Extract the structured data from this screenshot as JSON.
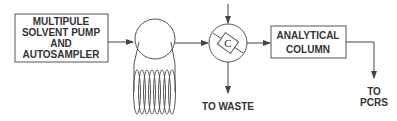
{
  "diagram": {
    "type": "flow-schematic",
    "nodes": {
      "pump": {
        "lines": [
          "MULTIPULE",
          "SOLVENT PUMP",
          "AND",
          "AUTOSAMPLER"
        ]
      },
      "loop_valve": {
        "label": ""
      },
      "column_valve": {
        "label": "C"
      },
      "column": {
        "lines": [
          "ANALYTICAL",
          "COLUMN"
        ]
      }
    },
    "outputs": {
      "waste": "TO WASTE",
      "pcrs": {
        "lines": [
          "TO",
          "PCRS"
        ]
      }
    },
    "edges": [
      {
        "from": "pump",
        "to": "loop_valve"
      },
      {
        "from": "loop_valve",
        "to": "column_valve"
      },
      {
        "from": "top-inlet",
        "to": "column_valve"
      },
      {
        "from": "column_valve",
        "to": "column"
      },
      {
        "from": "column_valve",
        "to": "waste"
      },
      {
        "from": "column",
        "to": "pcrs"
      }
    ],
    "colors": {
      "stroke": "#444444",
      "text": "#333333",
      "background": "#ffffff"
    }
  }
}
